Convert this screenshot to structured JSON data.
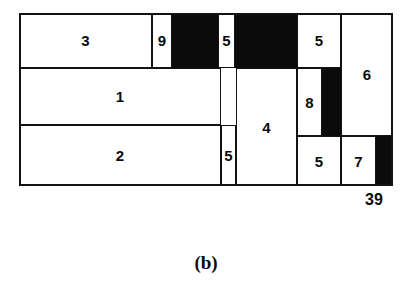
{
  "figure": {
    "caption": "(b)",
    "height_label": "39",
    "colors": {
      "ink": "#0b0b0b",
      "paper": "#ffffff"
    }
  },
  "chart_data": {
    "type": "table",
    "title": "(b)",
    "xlabel": "",
    "ylabel": "",
    "annotations": [
      "39"
    ],
    "strip": {
      "x": 0,
      "y": 0,
      "width": 374,
      "height": 173,
      "units": "px"
    },
    "categories": [
      "1",
      "2",
      "3",
      "4",
      "5",
      "5",
      "5",
      "5",
      "6",
      "7",
      "8",
      "9"
    ],
    "values": [
      1,
      2,
      3,
      4,
      5,
      5,
      5,
      5,
      6,
      7,
      8,
      9
    ],
    "items": [
      {
        "label": "3",
        "kind": "item",
        "x": 0,
        "y": 0,
        "w": 133,
        "h": 55
      },
      {
        "label": "9",
        "kind": "item",
        "x": 133,
        "y": 0,
        "w": 20,
        "h": 55
      },
      {
        "label": "",
        "kind": "waste",
        "x": 153,
        "y": 0,
        "w": 46,
        "h": 55
      },
      {
        "label": "5",
        "kind": "item",
        "x": 199,
        "y": 0,
        "w": 17,
        "h": 55
      },
      {
        "label": "",
        "kind": "waste",
        "x": 216,
        "y": 0,
        "w": 62,
        "h": 55
      },
      {
        "label": "5",
        "kind": "item",
        "x": 278,
        "y": 0,
        "w": 44,
        "h": 55
      },
      {
        "label": "6",
        "kind": "item",
        "x": 322,
        "y": 0,
        "w": 52,
        "h": 123
      },
      {
        "label": "1",
        "kind": "item",
        "x": 0,
        "y": 55,
        "w": 202,
        "h": 57
      },
      {
        "label": "4",
        "kind": "item",
        "x": 217,
        "y": 55,
        "w": 61,
        "h": 118
      },
      {
        "label": "8",
        "kind": "item",
        "x": 278,
        "y": 55,
        "w": 25,
        "h": 68
      },
      {
        "label": "",
        "kind": "waste",
        "x": 303,
        "y": 55,
        "w": 19,
        "h": 68
      },
      {
        "label": "2",
        "kind": "item",
        "x": 0,
        "y": 112,
        "w": 202,
        "h": 61
      },
      {
        "label": "5",
        "kind": "item",
        "x": 202,
        "y": 112,
        "w": 15,
        "h": 61
      },
      {
        "label": "5",
        "kind": "item",
        "x": 278,
        "y": 123,
        "w": 44,
        "h": 50
      },
      {
        "label": "7",
        "kind": "item",
        "x": 322,
        "y": 123,
        "w": 35,
        "h": 50
      },
      {
        "label": "",
        "kind": "waste",
        "x": 357,
        "y": 123,
        "w": 17,
        "h": 50
      }
    ]
  }
}
